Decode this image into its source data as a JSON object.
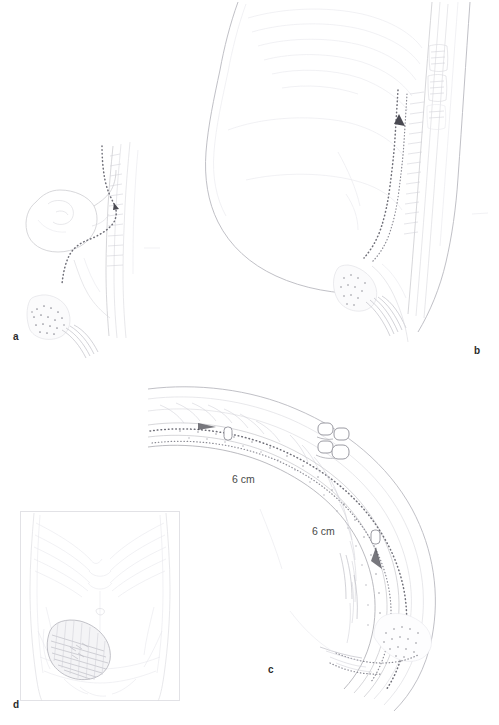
{
  "figure": {
    "background_color": "#ffffff",
    "width_px": 499,
    "height_px": 725,
    "style": "medical line-art illustration, faint pencil rendering"
  },
  "panels": [
    {
      "id": "a",
      "letter": "a",
      "name": "sagittal-lower-abdomen-detail",
      "description": "Sagittal section of the lower abdominal wall showing bladder, pubic bone and mesh fixation with dotted mesh line",
      "letter_position": {
        "x": 13,
        "y": 332
      }
    },
    {
      "id": "b",
      "letter": "b",
      "name": "sagittal-full-torso",
      "description": "Sagittal view of the full torso showing the retromuscular mesh extending along the posterior rectus sheath with directional arrow",
      "letter_position": {
        "x": 474,
        "y": 346
      }
    },
    {
      "id": "c",
      "letter": "c",
      "name": "abdominal-wall-cross-section",
      "description": "Enlarged cross-section of the abdominal wall layers with mesh overlap, suture clips and measured overlap distances",
      "letter_position": {
        "x": 268,
        "y": 665
      }
    },
    {
      "id": "d",
      "letter": "d",
      "name": "anterior-torso-hernia-location",
      "description": "Anterior view of the torso showing the hernia defect location shaded on the left lower abdomen",
      "letter_position": {
        "x": 13,
        "y": 700
      }
    }
  ],
  "annotations": {
    "measurements": [
      {
        "id": "measure-1",
        "text": "6 cm",
        "panel": "c",
        "x": 232,
        "y": 474
      },
      {
        "id": "measure-2",
        "text": "6 cm",
        "panel": "c",
        "x": 312,
        "y": 526
      }
    ]
  },
  "colors": {
    "background": "#ffffff",
    "line_primary": "#c9c9cd",
    "line_soft": "#dcdce0",
    "line_dark": "#a9a9b0",
    "mesh_dots": "#6f6f78",
    "text": "#2b2b2b",
    "measure_text": "#4a4a4a"
  }
}
